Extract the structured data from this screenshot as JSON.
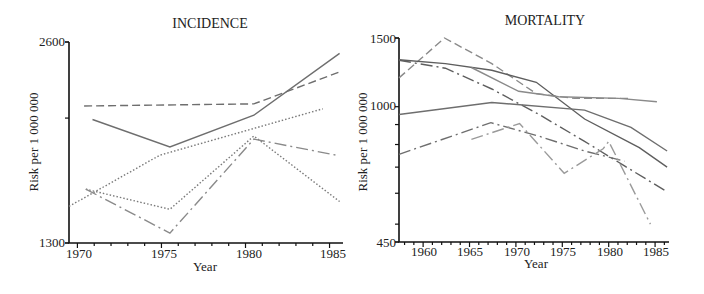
{
  "chart_data": [
    {
      "type": "line",
      "title": "INCIDENCE",
      "xlabel": "Year",
      "ylabel": "Risk per 1 000 000",
      "yscale": "log",
      "xlim": [
        1969.5,
        1985.8
      ],
      "ylim": [
        1300,
        2600
      ],
      "x_ticks": [
        1970,
        1975,
        1980,
        1985
      ],
      "y_tick_labels": [
        "2600",
        "1300"
      ],
      "y_minor_ticks": [
        2000
      ],
      "grid": false,
      "legend": null,
      "series": [
        {
          "name": "series-dashed",
          "style": "dashed",
          "color": "#6e6e6e",
          "points": [
            [
              1970.4,
              2085
            ],
            [
              1980.5,
              2100
            ],
            [
              1985.6,
              2345
            ]
          ]
        },
        {
          "name": "series-solid",
          "style": "solid",
          "color": "#6e6e6e",
          "points": [
            [
              1970.9,
              1990
            ],
            [
              1975.5,
              1810
            ],
            [
              1980.5,
              2020
            ],
            [
              1985.6,
              2500
            ]
          ]
        },
        {
          "name": "series-dotted-rising",
          "style": "dotted",
          "color": "#7a7a7a",
          "points": [
            [
              1969.5,
              1475
            ],
            [
              1974.9,
              1760
            ],
            [
              1984.6,
              2065
            ]
          ]
        },
        {
          "name": "series-dotted-peak",
          "style": "dotted",
          "color": "#7a7a7a",
          "points": [
            [
              1970.5,
              1565
            ],
            [
              1975.5,
              1460
            ],
            [
              1980.5,
              1880
            ],
            [
              1985.6,
              1500
            ]
          ]
        },
        {
          "name": "series-dash-dot",
          "style": "dash-dot",
          "color": "#8a8a8a",
          "points": [
            [
              1970.5,
              1565
            ],
            [
              1975.5,
              1345
            ],
            [
              1980.5,
              1860
            ],
            [
              1985.4,
              1760
            ]
          ]
        }
      ]
    },
    {
      "type": "line",
      "title": "MORTALITY",
      "xlabel": "Year",
      "ylabel": "Risk per 1 000 000",
      "yscale": "log",
      "xlim": [
        1957.4,
        1986.5
      ],
      "ylim": [
        450,
        1500
      ],
      "x_ticks": [
        1960,
        1965,
        1970,
        1975,
        1980,
        1985
      ],
      "y_tick_labels": [
        "1500",
        "1000",
        "450"
      ],
      "y_minor_ticks": [
        900,
        800,
        700,
        600,
        500
      ],
      "grid": false,
      "legend": null,
      "series": [
        {
          "name": "series-dashed-peak",
          "style": "dashed",
          "color": "#8a8a8a",
          "points": [
            [
              1957.4,
              1185
            ],
            [
              1962.3,
              1500
            ],
            [
              1967.4,
              1290
            ],
            [
              1972.2,
              1080
            ],
            [
              1976.3,
              1050
            ],
            [
              1982.2,
              1050
            ]
          ]
        },
        {
          "name": "series-solid-a",
          "style": "solid",
          "color": "#5e5e5e",
          "points": [
            [
              1957.4,
              1320
            ],
            [
              1962.4,
              1290
            ],
            [
              1967.4,
              1240
            ],
            [
              1972.2,
              1155
            ],
            [
              1977.4,
              930
            ],
            [
              1983.3,
              785
            ],
            [
              1986.3,
              700
            ]
          ]
        },
        {
          "name": "series-dash-dot-a",
          "style": "dash-dot",
          "color": "#5e5e5e",
          "points": [
            [
              1957.4,
              1315
            ],
            [
              1962.4,
              1255
            ],
            [
              1967.4,
              1110
            ],
            [
              1972.5,
              955
            ],
            [
              1977.4,
              815
            ],
            [
              1981.7,
              705
            ],
            [
              1986.3,
              605
            ]
          ]
        },
        {
          "name": "series-solid-b",
          "style": "solid",
          "color": "#8a8a8a",
          "points": [
            [
              1965.2,
              1260
            ],
            [
              1970.3,
              1095
            ],
            [
              1974.6,
              1060
            ],
            [
              1981.1,
              1050
            ],
            [
              1985.2,
              1030
            ]
          ]
        },
        {
          "name": "series-solid-c",
          "style": "solid",
          "color": "#6e6e6e",
          "points": [
            [
              1957.4,
              955
            ],
            [
              1967.4,
              1025
            ],
            [
              1977.4,
              980
            ],
            [
              1982.4,
              885
            ],
            [
              1986.3,
              770
            ]
          ]
        },
        {
          "name": "series-dash-dot-b",
          "style": "dash-dot",
          "color": "#6e6e6e",
          "points": [
            [
              1957.4,
              755
            ],
            [
              1967.3,
              910
            ],
            [
              1972.5,
              840
            ],
            [
              1977.4,
              770
            ],
            [
              1981.7,
              725
            ]
          ]
        },
        {
          "name": "series-dash-dot-c",
          "style": "dash-dot",
          "color": "#9a9a9a",
          "points": [
            [
              1965.2,
              825
            ],
            [
              1970.4,
              905
            ],
            [
              1975.2,
              675
            ],
            [
              1979.4,
              780
            ],
            [
              1980.0,
              815
            ],
            [
              1984.5,
              500
            ]
          ]
        }
      ]
    }
  ],
  "charts": {
    "left": {
      "title": "INCIDENCE",
      "xlabel": "Year",
      "ylabel": "Risk per 1 000 000",
      "ymax_label": "2600",
      "ymin_label": "1300",
      "xticks": [
        "1970",
        "1975",
        "1980",
        "1985"
      ]
    },
    "right": {
      "title": "MORTALITY",
      "xlabel": "Year",
      "ylabel": "Risk per 1 000 000",
      "ymax_label": "1500",
      "ymid_label": "1000",
      "ymin_label": "450",
      "xticks": [
        "1960",
        "1965",
        "1970",
        "1975",
        "1980",
        "1985"
      ]
    }
  }
}
